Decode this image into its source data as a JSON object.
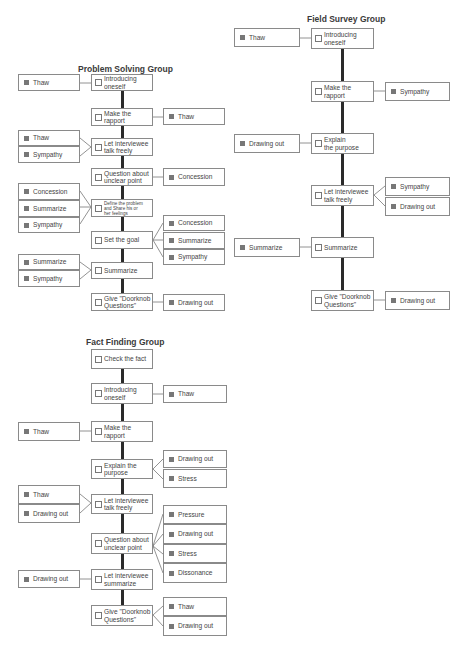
{
  "groups": {
    "problem_solving": {
      "title": "Problem Solving Group",
      "steps": [
        {
          "label": "Introducing\noneself"
        },
        {
          "label": "Make the\nrapport"
        },
        {
          "label": "Let interviewee\ntalk freely"
        },
        {
          "label": "Question about\nunclear point"
        },
        {
          "label": "Define the problem\nand Share his or\nher feelings"
        },
        {
          "label": "Set the goal"
        },
        {
          "label": "Summarize"
        },
        {
          "label": "Give \"Doorknob\nQuestions\""
        }
      ],
      "left_tags": [
        {
          "label": "Thaw",
          "step": 0
        },
        {
          "label": "Thaw",
          "step": 2
        },
        {
          "label": "Sympathy",
          "step": 2
        },
        {
          "label": "Concession",
          "step": 4
        },
        {
          "label": "Summarize",
          "step": 4
        },
        {
          "label": "Sympathy",
          "step": 4
        },
        {
          "label": "Summarize",
          "step": 6
        },
        {
          "label": "Sympathy",
          "step": 6
        }
      ],
      "right_tags": [
        {
          "label": "Thaw",
          "step": 1
        },
        {
          "label": "Concession",
          "step": 3
        },
        {
          "label": "Concession",
          "step": 5
        },
        {
          "label": "Summarize",
          "step": 5
        },
        {
          "label": "Sympathy",
          "step": 5
        },
        {
          "label": "Drawing out",
          "step": 7
        }
      ]
    },
    "field_survey": {
      "title": "Field Survey Group",
      "steps": [
        {
          "label": "Introducing\noneself"
        },
        {
          "label": "Make the\nrapport"
        },
        {
          "label": "Explain\nthe purpose"
        },
        {
          "label": "Let interviewee\ntalk freely"
        },
        {
          "label": "Summarize"
        },
        {
          "label": "Give \"Doorknob\nQuestions\""
        }
      ],
      "left_tags": [
        {
          "label": "Thaw",
          "step": 0
        },
        {
          "label": "Drawing out",
          "step": 2
        },
        {
          "label": "Summarize",
          "step": 4
        }
      ],
      "right_tags": [
        {
          "label": "Sympathy",
          "step": 1
        },
        {
          "label": "Sympathy",
          "step": 3
        },
        {
          "label": "Drawing out",
          "step": 3
        },
        {
          "label": "Drawing out",
          "step": 5
        }
      ]
    },
    "fact_finding": {
      "title": "Fact Finding Group",
      "steps": [
        {
          "label": "Check the fact"
        },
        {
          "label": "Introducing\noneself"
        },
        {
          "label": "Make the\nrapport"
        },
        {
          "label": "Explain the\npurpose"
        },
        {
          "label": "Let interviewee\ntalk freely"
        },
        {
          "label": "Question about\nunclear point"
        },
        {
          "label": "Let interviewee\nsummarize"
        },
        {
          "label": "Give \"Doorknob\nQuestions\""
        }
      ],
      "left_tags": [
        {
          "label": "Thaw",
          "step": 2
        },
        {
          "label": "Thaw",
          "step": 4
        },
        {
          "label": "Drawing out",
          "step": 4
        },
        {
          "label": "Drawing out",
          "step": 6
        }
      ],
      "right_tags": [
        {
          "label": "Thaw",
          "step": 1
        },
        {
          "label": "Drawing out",
          "step": 3
        },
        {
          "label": "Stress",
          "step": 3
        },
        {
          "label": "Pressure",
          "step": 5
        },
        {
          "label": "Drawing out",
          "step": 5
        },
        {
          "label": "Stress",
          "step": 5
        },
        {
          "label": "Dissonance",
          "step": 5
        },
        {
          "label": "Thaw",
          "step": 7
        },
        {
          "label": "Drawing out",
          "step": 7
        }
      ]
    }
  }
}
